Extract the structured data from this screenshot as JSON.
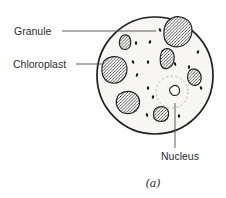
{
  "figure": {
    "caption": "(a)",
    "labels": {
      "granule": "Granule",
      "chloroplast": "Chloroplast",
      "nucleus": "Nucleus"
    }
  },
  "colors": {
    "ink": "#1f1f1f",
    "outline": "#1f1f1f",
    "leader": "#4a4a4a",
    "cell_fill": "#f8f7f3",
    "stipple": "#d9d5cb",
    "hatch": "#1f1f1f",
    "nucleus_ring": "#b7b2a6",
    "nucleus_fill": "#fdfdfb",
    "granule": "#141414",
    "label_text": "#2e2e2e"
  },
  "diagram": {
    "cell": {
      "cx": 155,
      "cy": 75.5,
      "rx": 58,
      "ry": 58.5
    },
    "chloroplasts": [
      "M168,21 Q175,14 184,18 Q193,22 192,32 Q191,41 183,45.5 Q175,49 168,44 Q163,39.5 164,31 Q164.5,25 168,21 Z",
      "M121.5,36.5 Q125,33.5 128.5,36 Q131.5,39 130.5,44.5 Q129.5,49.5 124.5,49.5 Q120,49 119.5,44 Q119,39.5 121.5,36.5 Z",
      "M162,51 Q166.5,47 171,50 Q175,53.5 174,60 Q173,66.5 167.5,68.5 Q162,69.5 160.5,63.5 Q159.5,56 162,51 Z",
      "M104,61 Q110,55.5 118,57 Q126,59 127,67.5 Q127.5,76.5 120.5,81.5 Q112.5,85.5 106,80.5 Q101,75.5 102,67.5 Q102.5,63.5 104,61 Z",
      "M189.5,70.5 Q194,67 198.5,71 Q202.5,75.5 200.5,81.5 Q198,86.5 192.5,85 Q188,83 187.5,77.5 Q187.5,73 189.5,70.5 Z",
      "M119,94.5 Q126,89.5 133.5,92.5 Q140.5,96 139.5,104 Q138,112 130,113.5 Q121.5,114.5 117.5,107.5 Q114.5,100 119,94.5 Z",
      "M154.5,110 Q158,105.5 164,107 Q169.5,109 168.5,115.5 Q167,121.5 160,121.5 Q153.5,120.5 153.5,115 Q153.5,112 154.5,110 Z"
    ],
    "granules": [
      [
        160,
        30
      ],
      [
        136,
        43
      ],
      [
        150,
        42
      ],
      [
        133,
        62
      ],
      [
        148,
        62
      ],
      [
        137,
        75
      ],
      [
        175,
        64
      ],
      [
        189,
        67
      ],
      [
        198,
        52
      ],
      [
        201,
        88
      ],
      [
        148,
        88
      ],
      [
        153,
        97
      ],
      [
        147,
        115
      ],
      [
        179,
        116
      ]
    ],
    "nucleus": {
      "ring": {
        "cx": 172,
        "cy": 92,
        "r": 16
      },
      "body": "M171.5,87 Q174.5,84 178,86.5 Q180.5,89.5 179,93.5 Q176.5,96.5 172.5,95 Q169.5,92.5 169.5,90 Q169.5,88.5 171.5,87 Z"
    },
    "leaders": [
      {
        "name": "granule-leader-line",
        "x1": 62,
        "y1": 31,
        "x2": 156,
        "y2": 31
      },
      {
        "name": "chloroplast-leader-line",
        "x1": 76,
        "y1": 64,
        "x2": 103,
        "y2": 64
      },
      {
        "name": "nucleus-leader-line",
        "x1": 175,
        "y1": 103,
        "x2": 175,
        "y2": 148
      }
    ]
  }
}
